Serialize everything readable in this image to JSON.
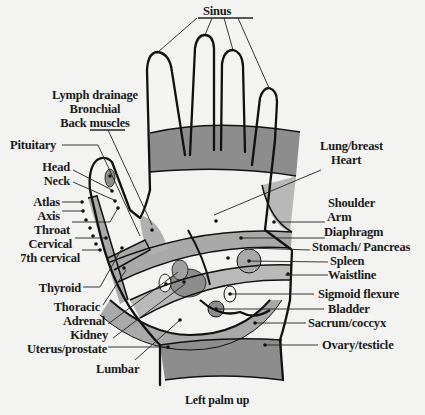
{
  "diagram": {
    "type": "reflexology-hand-map",
    "caption": "Left palm up",
    "colors": {
      "background": "#f3f3f1",
      "outline": "#111111",
      "shade_dark": "#8d8d8d",
      "shade_mid": "#a9a9a9",
      "shade_light": "#c4c4c4",
      "text": "#1a1a1a"
    },
    "labels": {
      "top": {
        "sinus": "Sinus"
      },
      "upper_left": {
        "lymph_drainage": "Lymph drainage",
        "bronchial": "Bronchial",
        "back_muscles": "Back muscles"
      },
      "left": {
        "pituitary": "Pituitary",
        "head": "Head",
        "neck": "Neck",
        "atlas": "Atlas",
        "axis": "Axis",
        "throat": "Throat",
        "cervical": "Cervical",
        "seventh_cervical": "7th cervical",
        "thyroid": "Thyroid",
        "thoracic": "Thoracic",
        "adrenal": "Adrenal",
        "kidney": "Kidney",
        "uterus_prostate": "Uterus/prostate",
        "lumbar": "Lumbar"
      },
      "right": {
        "lung_breast": "Lung/breast",
        "heart": "Heart",
        "shoulder": "Shoulder",
        "arm": "Arm",
        "diaphragm": "Diaphragm",
        "stomach_pancreas": "Stomach/ Pancreas",
        "spleen": "Spleen",
        "waistline": "Waistline",
        "sigmoid_flexure": "Sigmoid flexure",
        "bladder": "Bladder",
        "sacrum_coccyx": "Sacrum/coccyx",
        "ovary_testicle": "Ovary/testicle"
      }
    }
  }
}
